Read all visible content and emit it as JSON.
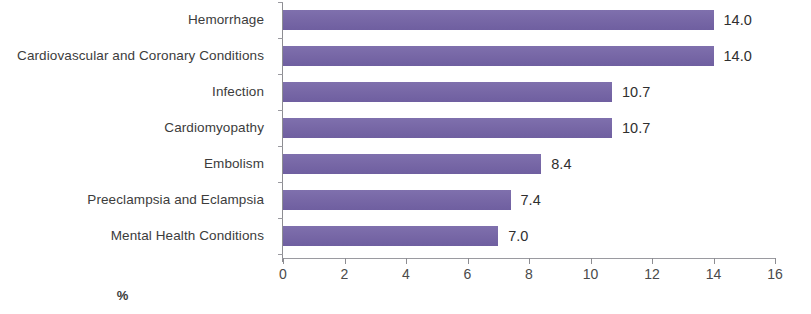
{
  "chart_data": {
    "type": "bar",
    "orientation": "horizontal",
    "title": "",
    "xlabel": "%",
    "ylabel": "",
    "xlim": [
      0,
      16
    ],
    "xticks": [
      0,
      2,
      4,
      6,
      8,
      10,
      12,
      14,
      16
    ],
    "xtick_labels": [
      "0",
      "2",
      "4",
      "6",
      "8",
      "10",
      "12",
      "14",
      "16"
    ],
    "grid": false,
    "legend": false,
    "bar_color": "#7b6aab",
    "categories": [
      "Hemorrhage",
      "Cardiovascular and Coronary Conditions",
      "Infection",
      "Cardiomyopathy",
      "Embolism",
      "Preeclampsia and Eclampsia",
      "Mental Health Conditions"
    ],
    "values": [
      14.0,
      14.0,
      10.7,
      10.7,
      8.4,
      7.4,
      7.0
    ],
    "value_labels": [
      "14.0",
      "14.0",
      "10.7",
      "10.7",
      "8.4",
      "7.4",
      "7.0"
    ]
  }
}
